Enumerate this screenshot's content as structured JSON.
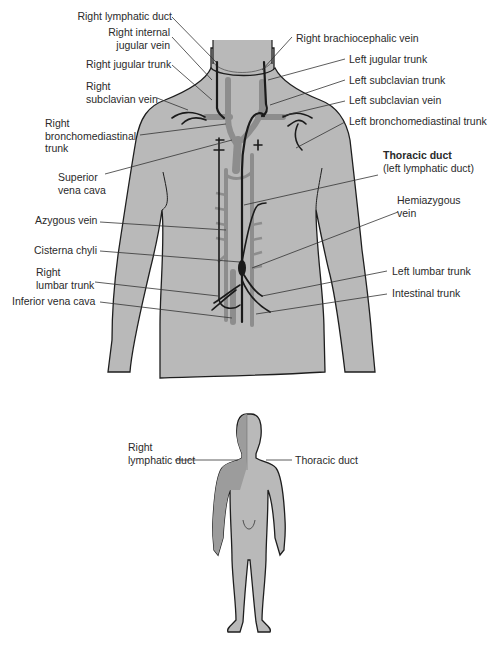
{
  "diagram": {
    "colors": {
      "skin": "#b9b9b9",
      "skin_dark": "#9c9c9c",
      "vein": "#8d8d8d",
      "lymph_vessel": "#1a1a1a",
      "outline": "#1e1e1e",
      "background": "#ffffff"
    },
    "torso_labels_left": [
      {
        "id": "right-lymphatic-duct",
        "text": "Right lymphatic duct"
      },
      {
        "id": "right-internal-jugular-vein",
        "line1": "Right internal",
        "line2": "jugular vein"
      },
      {
        "id": "right-jugular-trunk",
        "text": "Right jugular trunk"
      },
      {
        "id": "right-subclavian-vein",
        "line1": "Right",
        "line2": "subclavian vein"
      },
      {
        "id": "right-bronchomediastinal-trunk",
        "line1": "Right",
        "line2": "bronchomediastinal",
        "line3": "trunk"
      },
      {
        "id": "superior-vena-cava",
        "line1": "Superior",
        "line2": "vena cava"
      },
      {
        "id": "azygous-vein",
        "text": "Azygous vein"
      },
      {
        "id": "cisterna-chyli",
        "text": "Cisterna chyli"
      },
      {
        "id": "right-lumbar-trunk",
        "line1": "Right",
        "line2": "lumbar trunk"
      },
      {
        "id": "inferior-vena-cava",
        "text": "Inferior vena cava"
      }
    ],
    "torso_labels_right": [
      {
        "id": "right-brachiocephalic-vein",
        "text": "Right brachiocephalic vein"
      },
      {
        "id": "left-jugular-trunk",
        "text": "Left jugular trunk"
      },
      {
        "id": "left-subclavian-trunk",
        "text": "Left subclavian trunk"
      },
      {
        "id": "left-subclavian-vein",
        "text": "Left subclavian vein"
      },
      {
        "id": "left-bronchomediastinal-trunk",
        "text": "Left bronchomediastinal trunk"
      },
      {
        "id": "thoracic-duct",
        "line1": "Thoracic duct",
        "line2": "(left lymphatic duct)"
      },
      {
        "id": "hemiazygous-vein",
        "line1": "Hemiazygous",
        "line2": "vein"
      },
      {
        "id": "left-lumbar-trunk",
        "text": "Left lumbar trunk"
      },
      {
        "id": "intestinal-trunk",
        "text": "Intestinal trunk"
      }
    ],
    "figure_labels": {
      "right_lymphatic_duct": {
        "line1": "Right",
        "line2": "lymphatic duct"
      },
      "thoracic_duct": "Thoracic duct"
    }
  }
}
